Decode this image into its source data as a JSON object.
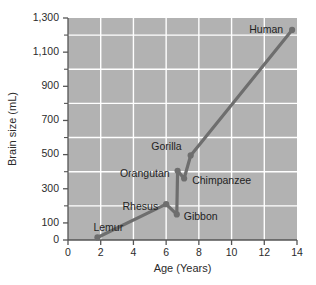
{
  "chart_data": {
    "type": "line",
    "title": "",
    "xlabel": "Age (Years)",
    "ylabel": "Brain size (mL)",
    "xlim": [
      0,
      14
    ],
    "ylim": [
      0,
      1300
    ],
    "grid": true,
    "legend": "none",
    "plot_background_color": "#b2b2b2",
    "gridline_color": "#ffffff",
    "series_color": "#6e6e6e",
    "x_ticks": [
      "0",
      "2",
      "4",
      "6",
      "8",
      "10",
      "12",
      "14"
    ],
    "x_tick_values": [
      0,
      2,
      4,
      6,
      8,
      10,
      12,
      14
    ],
    "y_ticks": [
      "0",
      "100",
      "300",
      "500",
      "700",
      "900",
      "1,100",
      "1,300"
    ],
    "y_tick_values": [
      0,
      100,
      300,
      500,
      700,
      900,
      1100,
      1300
    ],
    "y_minor_tick_values": [
      200,
      400,
      600,
      800,
      1000,
      1200
    ],
    "x_gridline_values": [
      2,
      4,
      6,
      8,
      10,
      12
    ],
    "y_gridline_values": [
      200,
      400,
      600,
      800,
      1000,
      1200
    ],
    "series": [
      {
        "name": "Primate brain size by age at maturity",
        "color": "#6e6e6e",
        "points": [
          {
            "label": "Lemur",
            "x": 1.8,
            "y": 15,
            "label_dx": -4,
            "label_dy": -9,
            "anchor": "start"
          },
          {
            "label": "Rhesus",
            "x": 6.0,
            "y": 210,
            "label_dx": -8,
            "label_dy": 3,
            "anchor": "end"
          },
          {
            "label": "Gibbon",
            "x": 6.65,
            "y": 150,
            "label_dx": 7,
            "label_dy": 3,
            "anchor": "start"
          },
          {
            "label": "Orangutan",
            "x": 6.7,
            "y": 405,
            "label_dx": -8,
            "label_dy": 3,
            "anchor": "end"
          },
          {
            "label": "Chimpanzee",
            "x": 7.1,
            "y": 360,
            "label_dx": 8,
            "label_dy": 3,
            "anchor": "start"
          },
          {
            "label": "Gorilla",
            "x": 7.5,
            "y": 495,
            "label_dx": -9,
            "label_dy": -8,
            "anchor": "end"
          },
          {
            "label": "Human",
            "x": 13.7,
            "y": 1230,
            "label_dx": -9,
            "label_dy": 0,
            "anchor": "end"
          }
        ],
        "line_path_values": [
          {
            "x": 1.8,
            "y": 15
          },
          {
            "x": 6.0,
            "y": 210
          },
          {
            "x": 6.65,
            "y": 150
          },
          {
            "x": 6.7,
            "y": 405
          },
          {
            "x": 7.1,
            "y": 360
          },
          {
            "x": 7.5,
            "y": 495
          },
          {
            "x": 13.7,
            "y": 1230
          }
        ]
      }
    ]
  }
}
